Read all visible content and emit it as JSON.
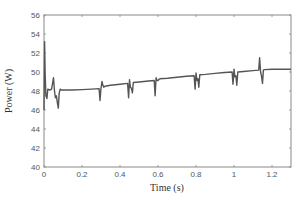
{
  "chart_data": {
    "type": "line",
    "title": "",
    "xlabel": "Time (s)",
    "ylabel": "Power (W)",
    "xlim": [
      0,
      1.3
    ],
    "ylim": [
      40,
      56
    ],
    "xticks": [
      0,
      0.2,
      0.4,
      0.6,
      0.8,
      1,
      1.2
    ],
    "xtick_labels": [
      "0",
      "0.2",
      "0.4",
      "0.6",
      "0.8",
      "1",
      "1.2"
    ],
    "yticks": [
      40,
      42,
      44,
      46,
      48,
      50,
      52,
      54,
      56
    ],
    "ytick_labels": [
      "40",
      "42",
      "44",
      "46",
      "48",
      "50",
      "52",
      "54",
      "56"
    ],
    "grid": false,
    "legend": null,
    "series": [
      {
        "name": "Power",
        "color": "#555555",
        "x": [
          0,
          0.003,
          0.006,
          0.01,
          0.015,
          0.02,
          0.03,
          0.04,
          0.05,
          0.055,
          0.06,
          0.065,
          0.07,
          0.075,
          0.08,
          0.085,
          0.09,
          0.095,
          0.1,
          0.15,
          0.2,
          0.25,
          0.29,
          0.295,
          0.3,
          0.305,
          0.31,
          0.315,
          0.32,
          0.35,
          0.4,
          0.44,
          0.445,
          0.45,
          0.455,
          0.46,
          0.465,
          0.47,
          0.5,
          0.55,
          0.58,
          0.585,
          0.59,
          0.595,
          0.6,
          0.605,
          0.61,
          0.65,
          0.7,
          0.75,
          0.79,
          0.795,
          0.8,
          0.805,
          0.81,
          0.815,
          0.82,
          0.85,
          0.9,
          0.95,
          0.99,
          0.995,
          1.0,
          1.005,
          1.01,
          1.015,
          1.02,
          1.05,
          1.1,
          1.13,
          1.135,
          1.14,
          1.145,
          1.15,
          1.155,
          1.16,
          1.2,
          1.25,
          1.3
        ],
        "values": [
          46.0,
          53.2,
          50.0,
          47.5,
          47.2,
          48.2,
          48.1,
          48.2,
          49.4,
          48.0,
          47.3,
          47.5,
          46.8,
          46.2,
          47.8,
          48.2,
          48.1,
          48.1,
          48.1,
          48.1,
          48.15,
          48.2,
          48.25,
          47.0,
          48.3,
          49.0,
          48.6,
          48.4,
          48.5,
          48.6,
          48.7,
          48.8,
          47.3,
          49.2,
          48.4,
          48.3,
          47.8,
          48.9,
          48.95,
          49.05,
          49.1,
          47.5,
          49.4,
          49.1,
          49.1,
          49.2,
          49.3,
          49.35,
          49.45,
          49.55,
          49.6,
          48.2,
          49.9,
          49.1,
          49.3,
          48.4,
          49.7,
          49.75,
          49.85,
          49.95,
          50.0,
          48.7,
          50.3,
          49.5,
          49.6,
          48.6,
          50.0,
          50.05,
          50.15,
          50.2,
          51.5,
          50.0,
          49.6,
          48.8,
          50.2,
          50.25,
          50.3,
          50.3,
          50.3
        ]
      }
    ]
  }
}
